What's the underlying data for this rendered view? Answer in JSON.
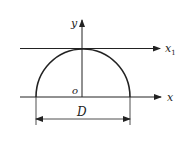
{
  "diagram": {
    "labels": {
      "y_axis": "y",
      "x1_axis": "x",
      "x1_subscript": "1",
      "x_axis": "x",
      "origin": "o",
      "dimension": "D"
    },
    "colors": {
      "line": "#222222",
      "background": "#ffffff"
    }
  }
}
